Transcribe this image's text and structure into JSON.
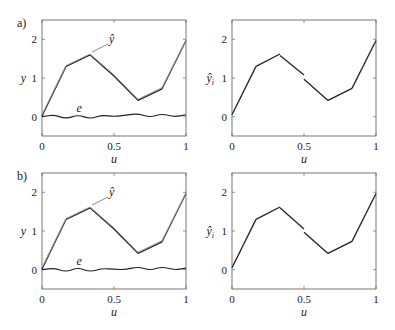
{
  "figure": {
    "panels": [
      {
        "label": "a)"
      },
      {
        "label": "b)"
      }
    ]
  },
  "axes_text": {
    "xlabel": "u",
    "ylabel_left": "y",
    "ylabel_right": "ŷ",
    "ylabel_right_sub": "i",
    "annotation_yhat": "ŷ",
    "annotation_e": "e",
    "xticks": [
      "0",
      "0.5",
      "1"
    ],
    "yticks": [
      "0",
      "1",
      "2"
    ]
  },
  "chart_data": [
    {
      "panel": "a) left",
      "type": "line",
      "xlabel": "u",
      "ylabel": "y",
      "xlim": [
        0,
        1
      ],
      "ylim": [
        -0.5,
        2.5
      ],
      "xticks": [
        0,
        0.5,
        1
      ],
      "yticks": [
        0,
        1,
        2
      ],
      "grid": false,
      "series": [
        {
          "name": "y",
          "x": [
            0,
            0.1667,
            0.3333,
            0.5,
            0.6667,
            0.8333,
            1
          ],
          "values": [
            0.02,
            1.3,
            1.6,
            1.05,
            0.42,
            0.72,
            1.97
          ]
        },
        {
          "name": "ŷ",
          "x": [
            0,
            0.1667,
            0.3333,
            0.5,
            0.6667,
            0.8333,
            1
          ],
          "values": [
            0.05,
            1.32,
            1.62,
            1.08,
            0.45,
            0.75,
            1.98
          ]
        },
        {
          "name": "e",
          "x": [
            0,
            0.0833,
            0.1667,
            0.25,
            0.3333,
            0.4167,
            0.5,
            0.5833,
            0.6667,
            0.75,
            0.8333,
            0.9167,
            1
          ],
          "values": [
            0.0,
            0.05,
            -0.06,
            0.05,
            -0.06,
            0.04,
            0.0,
            0.04,
            0.08,
            -0.02,
            0.08,
            -0.01,
            0.05
          ]
        }
      ],
      "annotations": [
        "ŷ",
        "e"
      ]
    },
    {
      "panel": "a) right",
      "type": "line",
      "xlabel": "u",
      "ylabel": "ŷ_i",
      "xlim": [
        0,
        1
      ],
      "ylim": [
        -0.5,
        2.5
      ],
      "xticks": [
        0,
        0.5,
        1
      ],
      "yticks": [
        0,
        1,
        2
      ],
      "grid": false,
      "series": [
        {
          "name": "segment 1",
          "x": [
            0,
            0.1667
          ],
          "values": [
            0.05,
            1.3
          ]
        },
        {
          "name": "segment 2",
          "x": [
            0.1667,
            0.3333
          ],
          "values": [
            1.3,
            1.62
          ]
        },
        {
          "name": "segment 3",
          "x": [
            0.3333,
            0.5
          ],
          "values": [
            1.58,
            1.08
          ]
        },
        {
          "name": "segment 4",
          "x": [
            0.5,
            0.6667
          ],
          "values": [
            0.97,
            0.42
          ]
        },
        {
          "name": "segment 5",
          "x": [
            0.6667,
            0.8333
          ],
          "values": [
            0.42,
            0.73
          ]
        },
        {
          "name": "segment 6",
          "x": [
            0.8333,
            1
          ],
          "values": [
            0.73,
            1.97
          ]
        }
      ]
    },
    {
      "panel": "b) left",
      "type": "line",
      "xlabel": "u",
      "ylabel": "y",
      "xlim": [
        0,
        1
      ],
      "ylim": [
        -0.5,
        2.5
      ],
      "xticks": [
        0,
        0.5,
        1
      ],
      "yticks": [
        0,
        1,
        2
      ],
      "grid": false,
      "series": [
        {
          "name": "y",
          "x": [
            0,
            0.1667,
            0.3333,
            0.5,
            0.6667,
            0.8333,
            1
          ],
          "values": [
            0.02,
            1.3,
            1.6,
            1.05,
            0.42,
            0.72,
            1.97
          ]
        },
        {
          "name": "ŷ",
          "x": [
            0,
            0.1667,
            0.3333,
            0.5,
            0.6667,
            0.8333,
            1
          ],
          "values": [
            0.05,
            1.32,
            1.62,
            1.08,
            0.45,
            0.75,
            1.98
          ]
        },
        {
          "name": "e",
          "x": [
            0,
            0.0833,
            0.1667,
            0.25,
            0.3333,
            0.4167,
            0.5,
            0.5833,
            0.6667,
            0.75,
            0.8333,
            0.9167,
            1
          ],
          "values": [
            0.0,
            0.04,
            -0.06,
            0.06,
            -0.06,
            0.03,
            0.01,
            0.0,
            0.08,
            -0.02,
            0.08,
            -0.01,
            0.04
          ]
        }
      ],
      "annotations": [
        "ŷ",
        "e"
      ]
    },
    {
      "panel": "b) right",
      "type": "line",
      "xlabel": "u",
      "ylabel": "ŷ_i",
      "xlim": [
        0,
        1
      ],
      "ylim": [
        -0.5,
        2.5
      ],
      "xticks": [
        0,
        0.5,
        1
      ],
      "yticks": [
        0,
        1,
        2
      ],
      "grid": false,
      "series": [
        {
          "name": "segment 1",
          "x": [
            0,
            0.1667
          ],
          "values": [
            0.05,
            1.3
          ]
        },
        {
          "name": "segment 2",
          "x": [
            0.1667,
            0.3333
          ],
          "values": [
            1.3,
            1.62
          ]
        },
        {
          "name": "segment 3",
          "x": [
            0.3333,
            0.5
          ],
          "values": [
            1.6,
            1.05
          ]
        },
        {
          "name": "segment 4",
          "x": [
            0.5,
            0.6667
          ],
          "values": [
            0.97,
            0.42
          ]
        },
        {
          "name": "segment 5",
          "x": [
            0.6667,
            0.8333
          ],
          "values": [
            0.42,
            0.73
          ]
        },
        {
          "name": "segment 6",
          "x": [
            0.8333,
            1
          ],
          "values": [
            0.73,
            1.97
          ]
        }
      ]
    }
  ]
}
